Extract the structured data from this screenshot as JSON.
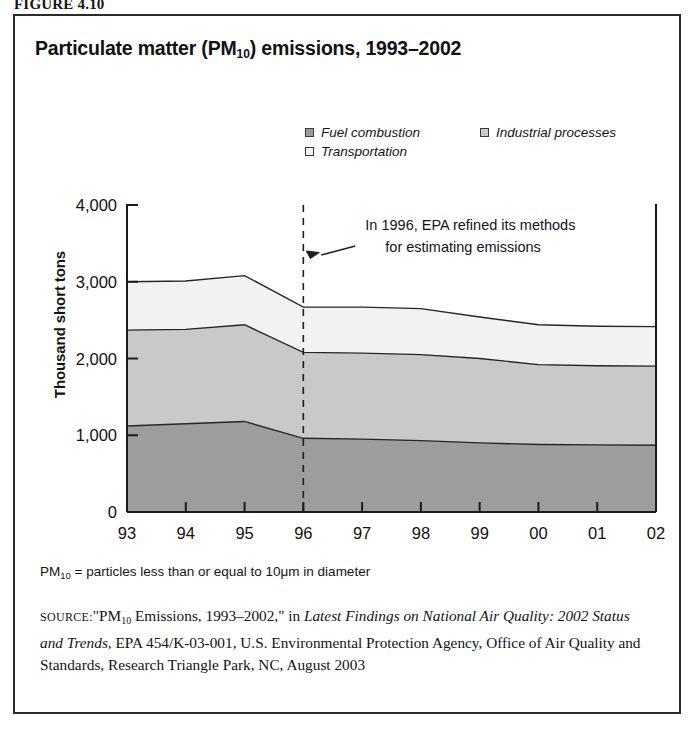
{
  "figure_number": "FIGURE 4.10",
  "chart": {
    "title_main": "Particulate matter (PM",
    "title_sub": "10",
    "title_tail": ") emissions, 1993–2002",
    "y_axis_title": "Thousand short tons",
    "annotation_line1": "In 1996, EPA refined its methods",
    "annotation_line2": "for estimating emissions",
    "legend": [
      {
        "label": "Fuel combustion",
        "color": "#9d9d9d"
      },
      {
        "label": "Industrial processes",
        "color": "#c9c9c9"
      },
      {
        "label": "Transportation",
        "color": "#f2f2f2"
      }
    ]
  },
  "footnote": {
    "pm_text": "PM",
    "pm_sub": "10",
    "rest": " = particles less than or equal to 10μm in diameter"
  },
  "source": {
    "label": "SOURCE:",
    "part1": "\"PM",
    "part1_sub": "10",
    "part2": " Emissions, 1993–2002,\" in ",
    "italic1": "Latest Findings on National Air Quality: 2002 Status and Trends,",
    "part3": " EPA 454/K-03-001, U.S. Environmental Protection Agency, Office of Air Quality and Standards, Research Triangle Park, NC, August 2003"
  },
  "chart_data": {
    "type": "area",
    "title": "Particulate matter (PM10) emissions, 1993–2002",
    "xlabel": "",
    "ylabel": "Thousand short tons",
    "ylim": [
      0,
      4000
    ],
    "yticks": [
      "0",
      "1,000",
      "2,000",
      "3,000",
      "4,000"
    ],
    "ytick_values": [
      0,
      1000,
      2000,
      3000,
      4000
    ],
    "grid": false,
    "stacked": true,
    "legend_position": "top-right",
    "categories": [
      "93",
      "94",
      "95",
      "96",
      "97",
      "98",
      "99",
      "00",
      "01",
      "02"
    ],
    "x_tick_labels": [
      "93",
      "94",
      "95",
      "96",
      "97",
      "98",
      "99",
      "00",
      "01",
      "02"
    ],
    "series": [
      {
        "name": "Fuel combustion",
        "color": "#9d9d9d",
        "values": [
          1120,
          1150,
          1180,
          960,
          950,
          930,
          900,
          880,
          875,
          870
        ]
      },
      {
        "name": "Industrial processes",
        "color": "#c9c9c9",
        "values": [
          1250,
          1230,
          1260,
          1120,
          1120,
          1120,
          1100,
          1040,
          1030,
          1030
        ]
      },
      {
        "name": "Transportation",
        "color": "#f2f2f2",
        "values": [
          630,
          630,
          640,
          590,
          600,
          600,
          540,
          520,
          515,
          515
        ]
      }
    ],
    "totals": [
      3000,
      3010,
      3080,
      2670,
      2670,
      2650,
      2540,
      2440,
      2420,
      2415
    ],
    "annotations": [
      {
        "text": "In 1996, EPA refined its methods for estimating emissions",
        "x_category": "96",
        "marker": "dashed-vertical-line"
      }
    ]
  }
}
